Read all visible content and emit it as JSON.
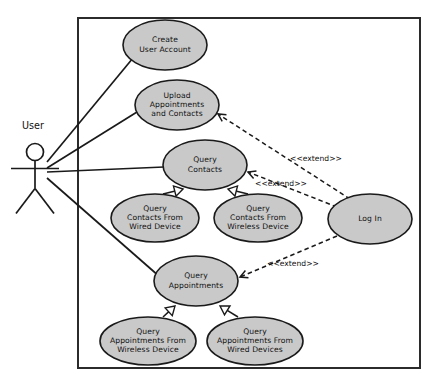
{
  "diagram": {
    "kind": "uml-use-case-diagram",
    "colors": {
      "use_case_fill": "#c9c9c9",
      "stroke": "#1a1a1a",
      "boundary_stroke": "#2b2b2b",
      "background": "#ffffff",
      "arrowhead_fill": "#ffffff"
    },
    "boundary": {
      "x": 78,
      "y": 18,
      "width": 342,
      "height": 350
    },
    "actor": {
      "name": "actor-user",
      "label": "User",
      "label_x": 33,
      "label_y": 126,
      "head_cx": 35,
      "head_cy": 152,
      "head_r": 8.5
    },
    "use_cases": [
      {
        "id": "create-user-account",
        "label_lines": [
          "Create",
          "User Account"
        ],
        "cx": 165,
        "cy": 45,
        "rx": 42,
        "ry": 25
      },
      {
        "id": "upload-appointments-and-contacts",
        "label_lines": [
          "Upload",
          "Appointments",
          "and Contacts"
        ],
        "cx": 177,
        "cy": 105,
        "rx": 42,
        "ry": 25
      },
      {
        "id": "query-contacts",
        "label_lines": [
          "Query",
          "Contacts"
        ],
        "cx": 205,
        "cy": 165,
        "rx": 42,
        "ry": 25
      },
      {
        "id": "query-contacts-from-wired-device",
        "label_lines": [
          "Query",
          "Contacts From",
          "Wired Device"
        ],
        "cx": 155,
        "cy": 218,
        "rx": 44,
        "ry": 24
      },
      {
        "id": "query-contacts-from-wireless-device",
        "label_lines": [
          "Query",
          "Contacts From",
          "Wireless Device"
        ],
        "cx": 258,
        "cy": 218,
        "rx": 44,
        "ry": 24
      },
      {
        "id": "log-in",
        "label_lines": [
          "Log In"
        ],
        "cx": 370,
        "cy": 219,
        "rx": 42,
        "ry": 25
      },
      {
        "id": "query-appointments",
        "label_lines": [
          "Query",
          "Appointments"
        ],
        "cx": 196,
        "cy": 281,
        "rx": 42,
        "ry": 25
      },
      {
        "id": "query-appointments-from-wireless-device",
        "label_lines": [
          "Query",
          "Appointments From",
          "Wireless Device"
        ],
        "cx": 148,
        "cy": 341,
        "rx": 48,
        "ry": 24
      },
      {
        "id": "query-appointments-from-wired-devices",
        "label_lines": [
          "Query",
          "Appointments From",
          "Wired Devices"
        ],
        "cx": 255,
        "cy": 341,
        "rx": 48,
        "ry": 24
      }
    ],
    "associations": [
      {
        "id": "assoc-user-create-user-account",
        "from": "actor-user",
        "to": "create-user-account",
        "x1": 47,
        "y1": 162,
        "x2": 133,
        "y2": 58
      },
      {
        "id": "assoc-user-upload-appointments",
        "from": "actor-user",
        "to": "upload-appointments-and-contacts",
        "x1": 47,
        "y1": 168,
        "x2": 137,
        "y2": 112
      },
      {
        "id": "assoc-user-query-contacts",
        "from": "actor-user",
        "to": "query-contacts",
        "x1": 47,
        "y1": 172,
        "x2": 164,
        "y2": 167
      },
      {
        "id": "assoc-user-query-appointments",
        "from": "actor-user",
        "to": "query-appointments",
        "x1": 47,
        "y1": 178,
        "x2": 160,
        "y2": 277
      }
    ],
    "generalizations": [
      {
        "id": "gen-wired-contacts-to-query-contacts",
        "from": "query-contacts-from-wired-device",
        "to": "query-contacts",
        "x1": 163,
        "y1": 194,
        "x2": 183,
        "y2": 189
      },
      {
        "id": "gen-wireless-contacts-to-query-contacts",
        "from": "query-contacts-from-wireless-device",
        "to": "query-contacts",
        "x1": 248,
        "y1": 194,
        "x2": 228,
        "y2": 189
      },
      {
        "id": "gen-wireless-appointments-to-query-appointments",
        "from": "query-appointments-from-wireless-device",
        "to": "query-appointments",
        "x1": 163,
        "y1": 317,
        "x2": 175,
        "y2": 306
      },
      {
        "id": "gen-wired-appointments-to-query-appointments",
        "from": "query-appointments-from-wired-devices",
        "to": "query-appointments",
        "x1": 238,
        "y1": 317,
        "x2": 220,
        "y2": 306
      }
    ],
    "extends": [
      {
        "id": "extend-login-to-upload",
        "label": "<<extend>>",
        "from": "log-in",
        "to": "upload-appointments-and-contacts",
        "x1": 350,
        "y1": 199,
        "x2": 218,
        "y2": 114,
        "label_x": 316,
        "label_y": 159
      },
      {
        "id": "extend-login-to-query-contacts",
        "label": "<<extend>>",
        "from": "log-in",
        "to": "query-contacts",
        "x1": 337,
        "y1": 207,
        "x2": 248,
        "y2": 172,
        "label_x": 281,
        "label_y": 184
      },
      {
        "id": "extend-login-to-query-appointments",
        "label": "<<extend>>",
        "from": "log-in",
        "to": "query-appointments",
        "x1": 337,
        "y1": 236,
        "x2": 240,
        "y2": 277,
        "label_x": 293,
        "label_y": 264
      }
    ]
  }
}
